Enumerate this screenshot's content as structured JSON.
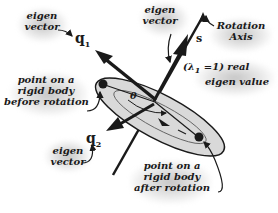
{
  "diagram": {
    "type": "rotation-eigenvector-illustration",
    "labels": {
      "eigen_vector_q1": {
        "line1": "eigen",
        "line2": "vector"
      },
      "eigen_vector_s": {
        "line1": "eigen",
        "line2": "vector"
      },
      "eigen_vector_q2": {
        "line1": "eigen",
        "line2": "vector"
      },
      "rotation_axis": {
        "line1": "Rotation",
        "line2": "Axis"
      },
      "eigen_value": {
        "line1": "(λ",
        "sub": "1",
        "line1_rest": " =1) real",
        "line2": "eigen value"
      },
      "point_before": {
        "line1": "point on a",
        "line2": "rigid body",
        "line3": "before rotation"
      },
      "point_after": {
        "line1": "point on a",
        "line2": "rigid body",
        "line3": "after rotation"
      }
    },
    "symbols": {
      "q1": {
        "base": "q",
        "sub": "1"
      },
      "q2": {
        "base": "q",
        "sub": "2"
      },
      "s": "s",
      "theta": "θ"
    },
    "colors": {
      "ink": "#1a1a1a",
      "ellipse_fill": "#d9d9d9",
      "shadow": "#a0a0a0",
      "background": "#ffffff"
    }
  }
}
